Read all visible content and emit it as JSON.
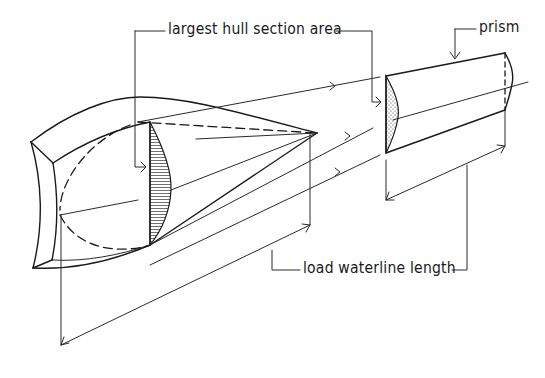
{
  "diagram": {
    "type": "technical-line-drawing",
    "ink_color": "#1a1a1a",
    "background_color": "#ffffff",
    "labels": {
      "section_area": "largest hull section area",
      "prism": "prism",
      "waterline_length": "load waterline length"
    }
  }
}
